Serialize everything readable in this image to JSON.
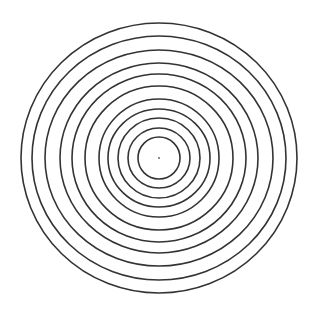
{
  "figure": {
    "type": "concentric-circles",
    "width": 318,
    "height": 311,
    "background": "#ffffff",
    "stroke_color": "#333333",
    "stroke_width": 1.6,
    "center": {
      "x": 159,
      "y": 158
    },
    "center_dot": {
      "radius": 0.9,
      "color": "#555555"
    },
    "ring_count": 11,
    "rings": [
      {
        "rx": 138,
        "ry": 135
      },
      {
        "rx": 127,
        "ry": 122
      },
      {
        "rx": 114,
        "ry": 108
      },
      {
        "rx": 99,
        "ry": 95
      },
      {
        "rx": 87,
        "ry": 84
      },
      {
        "rx": 74,
        "ry": 72
      },
      {
        "rx": 60,
        "ry": 59
      },
      {
        "rx": 51,
        "ry": 49
      },
      {
        "rx": 41,
        "ry": 40
      },
      {
        "rx": 31,
        "ry": 30
      },
      {
        "rx": 21,
        "ry": 21
      }
    ]
  }
}
